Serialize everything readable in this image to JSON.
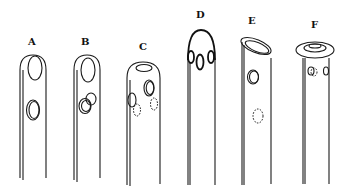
{
  "figure": {
    "tips": [
      {
        "id": "A",
        "label": "A"
      },
      {
        "id": "B",
        "label": "B"
      },
      {
        "id": "C",
        "label": "C"
      },
      {
        "id": "D",
        "label": "D"
      },
      {
        "id": "E",
        "label": "E"
      },
      {
        "id": "F",
        "label": "F"
      }
    ],
    "colors": {
      "line": "#1a1a1a",
      "background": "#ffffff"
    }
  }
}
